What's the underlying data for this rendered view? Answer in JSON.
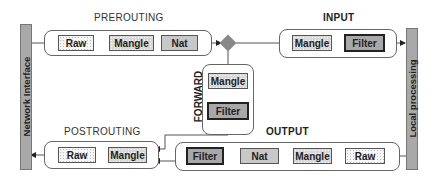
{
  "left_bar": {
    "label": "Network Interface"
  },
  "right_bar": {
    "label": "Local processing"
  },
  "chains": {
    "prerouting": {
      "title": "PREROUTING",
      "tables": [
        "Raw",
        "Mangle",
        "Nat"
      ]
    },
    "input": {
      "title": "INPUT",
      "tables": [
        "Mangle",
        "Filter"
      ]
    },
    "forward": {
      "title": "FORWARD",
      "tables": [
        "Mangle",
        "Filter"
      ]
    },
    "output": {
      "title": "OUTPUT",
      "tables": [
        "Filter",
        "Nat",
        "Mangle",
        "Raw"
      ]
    },
    "postrouting": {
      "title": "POSTROUTING",
      "tables": [
        "Raw",
        "Mangle"
      ]
    }
  },
  "decision": {
    "shape": "diamond",
    "meaning": "routing-decision"
  },
  "colors": {
    "bar": "#a9a9a9",
    "filter": "#a8a8a8",
    "nat": "#c8c8c8",
    "mangle": "#d9d9d9",
    "raw": "#f6f6f6",
    "diamond": "#888888"
  }
}
